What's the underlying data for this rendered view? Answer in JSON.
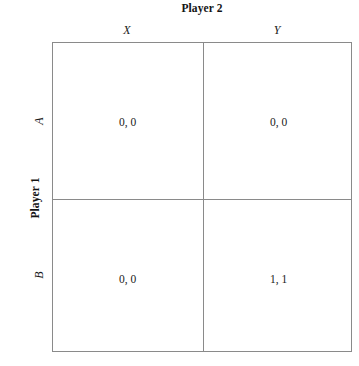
{
  "figure": {
    "column_player_title": "Player 2",
    "row_player_title": "Player 1",
    "column_headers": [
      "X",
      "Y"
    ],
    "row_headers": [
      "A",
      "B"
    ],
    "caption": "",
    "colors": {
      "border": "#8a8a8a",
      "background": "#ffffff",
      "text": "#1a1a1a"
    }
  },
  "chart_data": {
    "type": "table",
    "title": "Player 2",
    "xlabel": "Player 2",
    "ylabel": "Player 1",
    "categories": [
      "X",
      "Y"
    ],
    "row_categories": [
      "A",
      "B"
    ],
    "cells": [
      [
        {
          "row": "A",
          "col": "X",
          "text": "0, 0",
          "payoffs": [
            0,
            0
          ]
        },
        {
          "row": "A",
          "col": "Y",
          "text": "0, 0",
          "payoffs": [
            0,
            0
          ]
        }
      ],
      [
        {
          "row": "B",
          "col": "X",
          "text": "0, 0",
          "payoffs": [
            0,
            0
          ]
        },
        {
          "row": "B",
          "col": "Y",
          "text": "1, 1",
          "payoffs": [
            1,
            1
          ]
        }
      ]
    ],
    "grid": true,
    "legend": "none"
  }
}
